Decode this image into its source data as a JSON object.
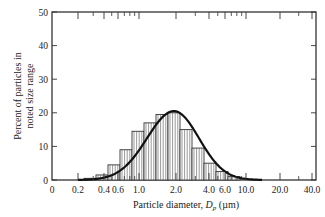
{
  "chart_data": {
    "type": "bar",
    "subtype": "histogram-with-fitted-curve",
    "title": "",
    "xlabel": "Particle diameter, D_p (µm)",
    "xlabel_parts": {
      "prefix": "Particle diameter, ",
      "symbol": "D",
      "subscript": "p",
      "suffix": " (µm)"
    },
    "ylabel_line1": "Percent of particles in",
    "ylabel_line2": "noted size range",
    "x_scale": "log",
    "x_tick_labels": [
      "0",
      "0.2",
      "0.4",
      "0.6",
      "1.0",
      "2.0",
      "4.0",
      "6.0",
      "10.0",
      "20.0",
      "40.0"
    ],
    "y_tick_labels": [
      "0",
      "10",
      "20",
      "30",
      "40",
      "50"
    ],
    "ylim": [
      0,
      50
    ],
    "grid": false,
    "legend": null,
    "bins": [
      {
        "from": 0.3,
        "to": 0.37,
        "value": 0.5
      },
      {
        "from": 0.37,
        "to": 0.45,
        "value": 1.5
      },
      {
        "from": 0.45,
        "to": 0.56,
        "value": 4.5
      },
      {
        "from": 0.56,
        "to": 0.7,
        "value": 9
      },
      {
        "from": 0.7,
        "to": 0.87,
        "value": 14.5
      },
      {
        "from": 0.87,
        "to": 1.08,
        "value": 17
      },
      {
        "from": 1.08,
        "to": 1.35,
        "value": 19.5
      },
      {
        "from": 1.35,
        "to": 1.7,
        "value": 20
      },
      {
        "from": 1.7,
        "to": 2.1,
        "value": 15
      },
      {
        "from": 2.1,
        "to": 2.6,
        "value": 9.5
      },
      {
        "from": 2.6,
        "to": 3.3,
        "value": 5
      },
      {
        "from": 3.3,
        "to": 4.1,
        "value": 2.5
      },
      {
        "from": 4.1,
        "to": 5.1,
        "value": 1
      }
    ],
    "curve": {
      "type": "lognormal-fit",
      "peak_percent": 20.5,
      "peak_diameter_um": 1.6
    }
  }
}
